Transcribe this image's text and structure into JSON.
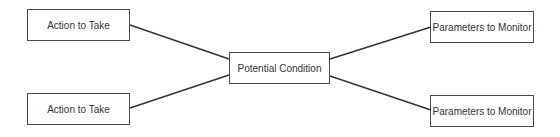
{
  "diagram": {
    "center": {
      "label": "Potential Condition"
    },
    "left": [
      {
        "label": "Action to Take"
      },
      {
        "label": "Action to Take"
      }
    ],
    "right": [
      {
        "label": "Parameters to Monitor"
      },
      {
        "label": "Parameters to Monitor"
      }
    ],
    "colors": {
      "line": "#333333",
      "border": "#4a4a4a",
      "text": "#333333"
    }
  }
}
